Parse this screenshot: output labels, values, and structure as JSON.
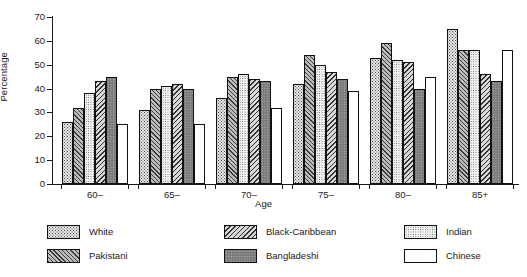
{
  "chart_data": {
    "type": "bar",
    "title": "",
    "subtitle": "",
    "xlabel": "Age",
    "ylabel": "Percentage",
    "categories": [
      "60–",
      "65–",
      "70–",
      "75–",
      "80–",
      "85+"
    ],
    "ylim": [
      0,
      70
    ],
    "yticks": [
      0,
      10,
      20,
      30,
      40,
      50,
      60,
      70
    ],
    "grid": false,
    "legend_position": "bottom",
    "series": [
      {
        "name": "White",
        "key": "white",
        "values": [
          26,
          31,
          36,
          42,
          53,
          65
        ]
      },
      {
        "name": "Pakistani",
        "key": "pakistani",
        "values": [
          32,
          40,
          45,
          54,
          59,
          56
        ]
      },
      {
        "name": "Indian",
        "key": "indian",
        "values": [
          38,
          41,
          46,
          50,
          52,
          56
        ]
      },
      {
        "name": "Black-Caribbean",
        "key": "black-caribbean",
        "values": [
          43,
          42,
          44,
          47,
          51,
          46
        ]
      },
      {
        "name": "Bangladeshi",
        "key": "bangladeshi",
        "values": [
          45,
          40,
          43,
          44,
          40,
          43
        ]
      },
      {
        "name": "Chinese",
        "key": "chinese",
        "values": [
          25,
          25,
          32,
          39,
          45,
          56
        ]
      }
    ]
  },
  "axes": {
    "y_title": "Percentage",
    "x_title": "Age",
    "y_tick_labels": [
      "0",
      "10",
      "20",
      "30",
      "40",
      "50",
      "60",
      "70"
    ],
    "x_tick_labels": [
      "60–",
      "65–",
      "70–",
      "75–",
      "80–",
      "85+"
    ]
  },
  "legend": {
    "entries": [
      {
        "label": "White",
        "swatch": "dotted-light",
        "column": 0,
        "row": 0
      },
      {
        "label": "Pakistani",
        "swatch": "hatch-right",
        "column": 0,
        "row": 1
      },
      {
        "label": "Black-Caribbean",
        "swatch": "hatch-left",
        "column": 1,
        "row": 0
      },
      {
        "label": "Bangladeshi",
        "swatch": "solid-grey",
        "column": 1,
        "row": 1
      },
      {
        "label": "Indian",
        "swatch": "dotted-fine",
        "column": 2,
        "row": 0
      },
      {
        "label": "Chinese",
        "swatch": "plain-white",
        "column": 2,
        "row": 1
      }
    ]
  },
  "colors": {
    "axis": "#1a1a1a",
    "background": "#ffffff",
    "white_series": "#e9e9e9",
    "pakistani_series": "#bdbdbd",
    "black_caribbean_series": "#d8d8d8",
    "bangladeshi_series": "#7c7c7c",
    "indian_series": "#f2f2f2",
    "chinese_series": "#ffffff"
  }
}
